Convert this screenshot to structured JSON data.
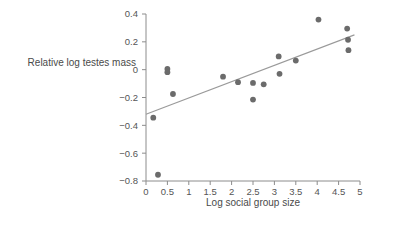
{
  "chart_data": {
    "type": "scatter",
    "title": "",
    "xlabel": "Log social group size",
    "ylabel": "Relative log testes mass",
    "xlim": [
      0,
      5
    ],
    "ylim": [
      -0.8,
      0.4
    ],
    "xticks": [
      "0",
      "0.5",
      "1",
      "1.5",
      "2",
      "2.5",
      "3",
      "3.5",
      "4",
      "4.5",
      "5"
    ],
    "xtick_values": [
      0,
      0.5,
      1,
      1.5,
      2,
      2.5,
      3,
      3.5,
      4,
      4.5,
      5
    ],
    "yticks": [
      "0.4",
      "0.2",
      "0",
      "−0.2",
      "−0.4",
      "−0.6",
      "−0.8"
    ],
    "ytick_values": [
      0.4,
      0.2,
      0,
      -0.2,
      -0.4,
      -0.6,
      -0.8
    ],
    "grid": false,
    "legend": false,
    "point_color": "#6b6b6b",
    "line_color": "#9a9a9a",
    "axis_color": "#8c8c8c",
    "background": "#ffffff",
    "points": [
      {
        "x": 0.17,
        "y": -0.345
      },
      {
        "x": 0.28,
        "y": -0.755
      },
      {
        "x": 0.5,
        "y": 0.005
      },
      {
        "x": 0.5,
        "y": -0.018
      },
      {
        "x": 0.63,
        "y": -0.175
      },
      {
        "x": 1.8,
        "y": -0.05
      },
      {
        "x": 2.15,
        "y": -0.09
      },
      {
        "x": 2.5,
        "y": -0.215
      },
      {
        "x": 2.5,
        "y": -0.095
      },
      {
        "x": 2.75,
        "y": -0.105
      },
      {
        "x": 3.1,
        "y": 0.095
      },
      {
        "x": 3.12,
        "y": -0.03
      },
      {
        "x": 3.5,
        "y": 0.065
      },
      {
        "x": 4.03,
        "y": 0.36
      },
      {
        "x": 4.7,
        "y": 0.295
      },
      {
        "x": 4.72,
        "y": 0.215
      },
      {
        "x": 4.73,
        "y": 0.14
      }
    ],
    "trend": {
      "x0": 0.0,
      "y0": -0.32,
      "x1": 4.87,
      "y1": 0.25
    }
  }
}
